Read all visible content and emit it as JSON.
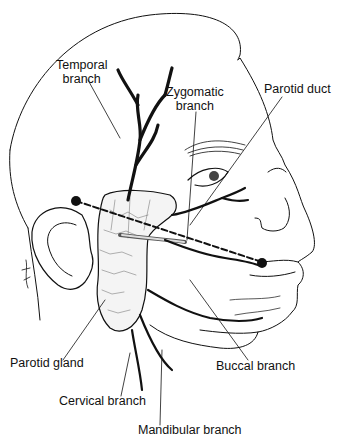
{
  "figure": {
    "type": "anatomical-illustration",
    "colors": {
      "ink": "#111111",
      "background": "#ffffff"
    }
  },
  "labels": {
    "temporal_line1": "Temporal",
    "temporal_line2": "branch",
    "zygomatic_line1": "Zygomatic",
    "zygomatic_line2": "branch",
    "parotid_duct": "Parotid duct",
    "parotid_gland": "Parotid gland",
    "buccal_branch": "Buccal branch",
    "cervical_branch": "Cervical branch",
    "mandibular_branch": "Mandibular branch"
  },
  "landmarks": {
    "reference_line": "dashed line from ear (tragus) to corner of mouth",
    "points": [
      "tragus",
      "oral commissure"
    ]
  }
}
